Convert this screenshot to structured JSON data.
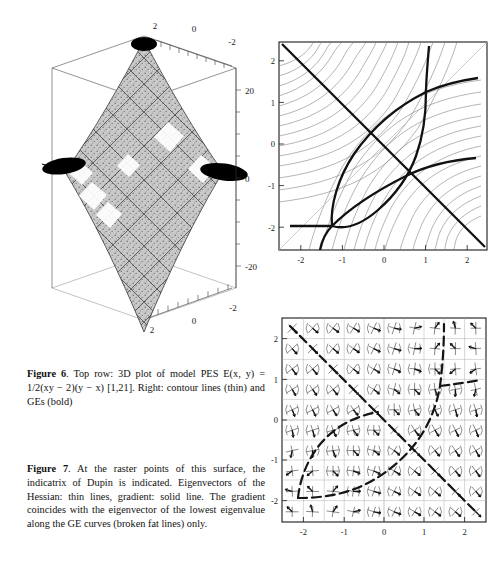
{
  "figure6": {
    "caption_label": "Figure 6",
    "caption_text": ". Top row: 3D plot of model PES E(x, y) = 1/2(xy − 2)(y − x) [1,21]. Right: contour lines (thin) and GEs (bold)",
    "surface_plot": {
      "name": "3D plot of model PES",
      "x_ticks": [
        "2",
        "0",
        "-2"
      ],
      "y_ticks": [
        "2",
        "0",
        "-2"
      ],
      "z_ticks": [
        "20",
        "0",
        "-20"
      ]
    },
    "contour_plot": {
      "name": "contour lines and gradient extremals",
      "x_ticks": [
        "-2",
        "-1",
        "0",
        "1",
        "2"
      ],
      "y_ticks": [
        "-2",
        "-1",
        "0",
        "1",
        "2"
      ],
      "xlim": [
        -2.5,
        2.5
      ],
      "ylim": [
        -2.5,
        2.5
      ]
    }
  },
  "figure7": {
    "caption_label": "Figure 7",
    "caption_text": ". At the raster points of this surface, the indicatrix of Dupin is indicated. Eigenvectors of the Hessian: thin lines, gradient: solid line. The gradient coincides with the eigenvector of the lowest eigenvalue along the GE curves (broken fat lines) only.",
    "vector_plot": {
      "name": "indicatrix of Dupin raster field",
      "x_ticks": [
        "-2",
        "-1",
        "0",
        "1",
        "2"
      ],
      "y_ticks": [
        "-2",
        "-1",
        "0",
        "1",
        "2"
      ],
      "xlim": [
        -2.5,
        2.5
      ],
      "ylim": [
        -2.5,
        2.5
      ]
    }
  },
  "chart_data": [
    {
      "type": "surface",
      "title": "3D plot of model PES",
      "function": "E(x, y) = 1/2(xy - 2)(y - x)",
      "xlabel": "x",
      "ylabel": "y",
      "zlabel": "E",
      "xlim": [
        -2.5,
        2.5
      ],
      "ylim": [
        -2.5,
        2.5
      ],
      "zlim": [
        -25,
        25
      ],
      "x_ticks": [
        2,
        0,
        -2
      ],
      "y_ticks": [
        2,
        0,
        -2
      ],
      "z_ticks": [
        20,
        0,
        -20
      ],
      "grid": false,
      "legend": "none"
    },
    {
      "type": "contour",
      "title": "contour lines (thin) and GEs (bold)",
      "function": "E(x, y) = 1/2(xy - 2)(y - x)",
      "xlabel": "x",
      "ylabel": "y",
      "xlim": [
        -2.5,
        2.5
      ],
      "ylim": [
        -2.5,
        2.5
      ],
      "x_ticks": [
        -2,
        -1,
        0,
        1,
        2
      ],
      "y_ticks": [
        -2,
        -1,
        0,
        1,
        2
      ],
      "grid": false,
      "legend": "none",
      "series": [
        {
          "name": "contour lines",
          "style": "thin"
        },
        {
          "name": "gradient extremals (GEs)",
          "style": "bold"
        }
      ],
      "saddle_points": [
        [
          -1.41,
          -1.41
        ],
        [
          1.41,
          1.41
        ]
      ],
      "ge_crossings": [
        [
          -0.65,
          0.65
        ],
        [
          0.65,
          -0.65
        ]
      ]
    },
    {
      "type": "quiver",
      "title": "indicatrix of Dupin at raster points",
      "xlabel": "x",
      "ylabel": "y",
      "xlim": [
        -2.5,
        2.5
      ],
      "ylim": [
        -2.5,
        2.5
      ],
      "x_ticks": [
        -2,
        -1,
        0,
        1,
        2
      ],
      "y_ticks": [
        -2,
        -1,
        0,
        1,
        2
      ],
      "grid": true,
      "legend": "none",
      "raster_step": 0.5,
      "series": [
        {
          "name": "Hessian eigenvectors",
          "style": "thin lines"
        },
        {
          "name": "gradient",
          "style": "solid line"
        },
        {
          "name": "GE curves",
          "style": "broken fat lines"
        }
      ]
    }
  ]
}
